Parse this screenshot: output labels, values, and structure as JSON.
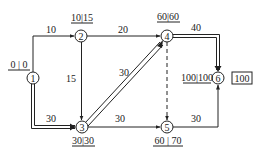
{
  "diagram": {
    "type": "activity-on-arrow network (CPM)",
    "nodes": [
      {
        "id": "1",
        "label": "1",
        "times": "0 | 0"
      },
      {
        "id": "2",
        "label": "2",
        "times": "10|15"
      },
      {
        "id": "3",
        "label": "3",
        "times": "30|30"
      },
      {
        "id": "4",
        "label": "4",
        "times": "60|60"
      },
      {
        "id": "5",
        "label": "5",
        "times": "60 | 70"
      },
      {
        "id": "6",
        "label": "6",
        "times": "100|100",
        "total": "100"
      }
    ],
    "edges": [
      {
        "from": "1",
        "to": "2",
        "duration": "10",
        "critical": false,
        "dummy": false
      },
      {
        "from": "1",
        "to": "3",
        "duration": "30",
        "critical": true,
        "dummy": false
      },
      {
        "from": "2",
        "to": "3",
        "duration": "15",
        "critical": false,
        "dummy": false
      },
      {
        "from": "2",
        "to": "4",
        "duration": "20",
        "critical": false,
        "dummy": false
      },
      {
        "from": "3",
        "to": "4",
        "duration": "30",
        "critical": true,
        "dummy": false
      },
      {
        "from": "3",
        "to": "5",
        "duration": "30",
        "critical": false,
        "dummy": false
      },
      {
        "from": "4",
        "to": "5",
        "duration": "",
        "critical": false,
        "dummy": true
      },
      {
        "from": "4",
        "to": "6",
        "duration": "40",
        "critical": true,
        "dummy": false
      },
      {
        "from": "5",
        "to": "6",
        "duration": "30",
        "critical": false,
        "dummy": false
      }
    ]
  },
  "colors": {
    "line": "#222222",
    "background": "#ffffff"
  }
}
